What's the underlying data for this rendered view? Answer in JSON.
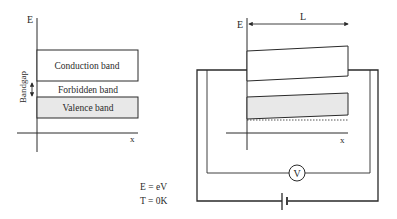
{
  "left_diagram": {
    "y_axis_label": "E",
    "x_axis_label": "x",
    "conduction_band_label": "Conduction band",
    "forbidden_band_label": "Forbidden band",
    "valence_band_label": "Valence band",
    "bandgap_label": "Bandgap"
  },
  "right_diagram": {
    "y_axis_label": "E",
    "x_axis_label": "x",
    "length_label": "L",
    "voltmeter_label": "V"
  },
  "conditions": {
    "energy": "E = eV",
    "temperature": "T = 0K"
  },
  "colors": {
    "line": "#2a2a2a",
    "valence_fill": "#e8e8e8"
  }
}
